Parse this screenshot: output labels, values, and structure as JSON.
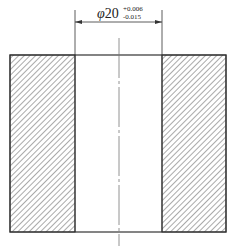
{
  "drawing": {
    "type": "section view of bushing with bore",
    "dimension": {
      "symbol": "φ",
      "nominal": "20",
      "upper_tolerance": "+0.006",
      "lower_tolerance": "-0.015"
    },
    "colors": {
      "outline": "#333333",
      "hatch": "#555555",
      "centerline": "#777777",
      "background": "#ffffff"
    }
  }
}
